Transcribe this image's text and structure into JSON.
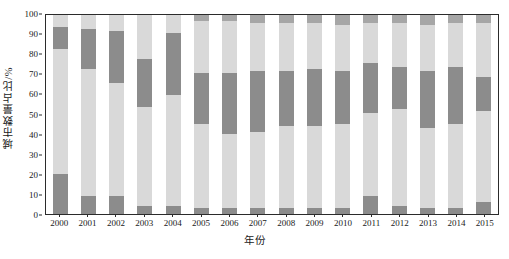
{
  "chart_data": {
    "type": "bar",
    "stacked": true,
    "stack_mode": "percent",
    "title": "",
    "xlabel": "年份",
    "ylabel": "城市数量占比/%",
    "ylim": [
      0,
      100
    ],
    "ytick_labels": [
      "0",
      "10",
      "20",
      "30",
      "40",
      "50",
      "60",
      "70",
      "80",
      "90",
      "100"
    ],
    "ytick_values": [
      0,
      10,
      20,
      30,
      40,
      50,
      60,
      70,
      80,
      90,
      100
    ],
    "grid": false,
    "legend": "none",
    "categories": [
      "2000",
      "2001",
      "2002",
      "2003",
      "2004",
      "2005",
      "2006",
      "2007",
      "2008",
      "2009",
      "2010",
      "2011",
      "2012",
      "2013",
      "2014",
      "2015"
    ],
    "series": [
      {
        "name": "segment-1",
        "color": "#8c8c8c",
        "values": [
          20,
          9,
          9,
          4,
          4,
          3,
          3,
          3,
          3,
          3,
          3,
          9,
          4,
          3,
          3,
          6
        ]
      },
      {
        "name": "segment-2",
        "color": "#d9d9d9",
        "values": [
          63,
          64,
          57,
          50,
          56,
          42,
          37,
          38,
          41,
          41,
          42,
          42,
          49,
          40,
          42,
          46
        ]
      },
      {
        "name": "segment-3",
        "color": "#8c8c8c",
        "values": [
          11,
          20,
          26,
          24,
          31,
          26,
          31,
          31,
          28,
          29,
          27,
          25,
          21,
          29,
          29,
          17
        ]
      },
      {
        "name": "segment-4",
        "color": "#d9d9d9",
        "values": [
          6,
          7,
          8,
          22,
          9,
          26,
          26,
          24,
          24,
          23,
          23,
          20,
          22,
          23,
          22,
          27
        ]
      },
      {
        "name": "segment-5",
        "color": "#a6a6a6",
        "values": [
          0,
          0,
          0,
          0,
          0,
          3,
          3,
          4,
          4,
          4,
          5,
          4,
          4,
          5,
          4,
          4
        ]
      }
    ]
  },
  "colors": {
    "dark_gray": "#8c8c8c",
    "light_gray": "#d9d9d9",
    "medium_gray": "#a6a6a6",
    "axis": "#2b2b2b",
    "background": "#ffffff"
  }
}
